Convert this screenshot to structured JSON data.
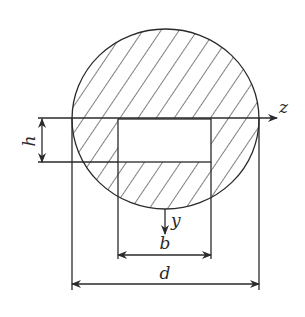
{
  "figure": {
    "labels": {
      "z_axis": "z",
      "y_axis": "y",
      "width_dim": "b",
      "diameter_dim": "d",
      "height_dim": "h"
    },
    "colors": {
      "line": "#2a2a2a",
      "background": "#ffffff"
    },
    "hatch": {
      "direction": "diagonal down-right",
      "spacing_px": 15
    }
  }
}
